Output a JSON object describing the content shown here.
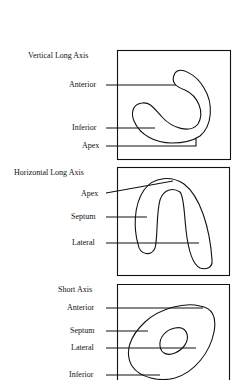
{
  "panels": [
    {
      "title": "Vertical Long Axis",
      "labels": [
        "Anterior",
        "Inferior",
        "Apex"
      ]
    },
    {
      "title": "Horizontal Long Axis",
      "labels": [
        "Apex",
        "Septum",
        "Lateral"
      ]
    },
    {
      "title": "Short Axis",
      "labels": [
        "Anterior",
        "Septum",
        "Lateral",
        "Inferior"
      ]
    }
  ],
  "colors": {
    "stroke": "#111111",
    "background": "#ffffff"
  }
}
